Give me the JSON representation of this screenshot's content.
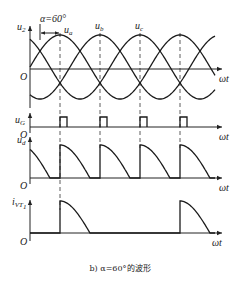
{
  "figure": {
    "caption": "b) α=60°的波形",
    "alpha_label": "α=60°",
    "x_axis_label": "ωt",
    "origin_label": "O"
  },
  "panels": {
    "u2": {
      "label": "u",
      "sub": "2",
      "phase_labels": [
        {
          "label": "u",
          "sub": "a"
        },
        {
          "label": "u",
          "sub": "b"
        },
        {
          "label": "u",
          "sub": "c"
        }
      ]
    },
    "uG": {
      "label": "u",
      "sub": "G"
    },
    "ud": {
      "label": "u",
      "sub": "d"
    },
    "ivt1": {
      "label": "i",
      "sub": "VT",
      "subsub": "1"
    }
  },
  "chart_data": {
    "type": "line",
    "xlabel": "ωt",
    "alpha_deg": 60,
    "firing_angles_deg": [
      90,
      210,
      330,
      450
    ],
    "series": [
      {
        "name": "u_a",
        "formula": "sin(ωt)"
      },
      {
        "name": "u_b",
        "formula": "sin(ωt-120°)"
      },
      {
        "name": "u_c",
        "formula": "sin(ωt-240°)"
      },
      {
        "name": "u_G",
        "description": "gate pulses at firing instants"
      },
      {
        "name": "u_d",
        "description": "output voltage: each phase from firing (α after natural commutation) to zero crossing, then zero"
      },
      {
        "name": "i_VT1",
        "description": "thyristor VT1 current: conducts from ωt=90° to 180° and 450° to 540°"
      }
    ]
  }
}
